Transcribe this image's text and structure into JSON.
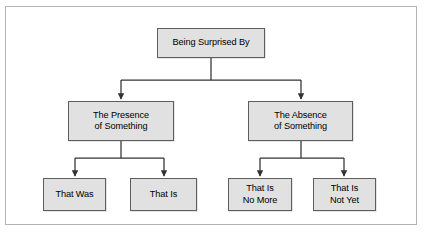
{
  "diagram": {
    "type": "tree-hierarchy",
    "orientation": "top-down",
    "colors": {
      "node_fill": "#e1e1e1",
      "node_border": "#5d5d5d",
      "connector": "#333333",
      "frame_border": "#b4b4b4",
      "background": "#ffffff",
      "text": "#000000"
    },
    "root": {
      "id": "root",
      "label": "Being Surprised By"
    },
    "level2": [
      {
        "id": "presence",
        "label_line1": "The Presence",
        "label_line2": "of Something"
      },
      {
        "id": "absence",
        "label_line1": "The Absence",
        "label_line2": "of Something"
      }
    ],
    "leaves": [
      {
        "id": "that-was",
        "parent": "presence",
        "label_line1": "That Was",
        "label_line2": ""
      },
      {
        "id": "that-is",
        "parent": "presence",
        "label_line1": "That Is",
        "label_line2": ""
      },
      {
        "id": "no-more",
        "parent": "absence",
        "label_line1": "That Is",
        "label_line2": "No More"
      },
      {
        "id": "not-yet",
        "parent": "absence",
        "label_line1": "That Is",
        "label_line2": "Not Yet"
      }
    ],
    "top_bleed": {
      "fragment1": "",
      "fragment2": "",
      "fragment3": ""
    }
  }
}
